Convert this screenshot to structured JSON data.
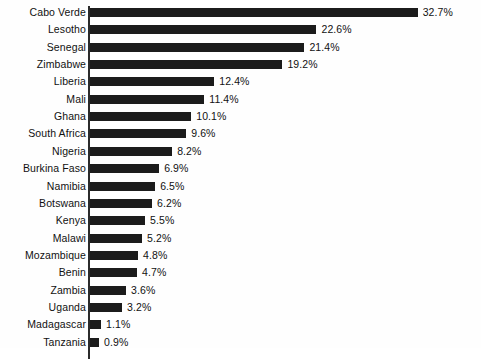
{
  "chart_data": {
    "type": "bar",
    "orientation": "horizontal",
    "title": "",
    "subtitle": "",
    "xlabel": "",
    "ylabel": "",
    "grid": false,
    "legend": null,
    "xlim": [
      0,
      32.7
    ],
    "value_suffix": "%",
    "categories": [
      "Cabo Verde",
      "Lesotho",
      "Senegal",
      "Zimbabwe",
      "Liberia",
      "Mali",
      "Ghana",
      "South Africa",
      "Nigeria",
      "Burkina Faso",
      "Namibia",
      "Botswana",
      "Kenya",
      "Malawi",
      "Mozambique",
      "Benin",
      "Zambia",
      "Uganda",
      "Madagascar",
      "Tanzania"
    ],
    "values": [
      32.7,
      22.6,
      21.4,
      19.2,
      12.4,
      11.4,
      10.1,
      9.6,
      8.2,
      6.9,
      6.5,
      6.2,
      5.5,
      5.2,
      4.8,
      4.7,
      3.6,
      3.2,
      1.1,
      0.9
    ],
    "value_labels": [
      "32.7%",
      "22.6%",
      "21.4%",
      "19.2%",
      "12.4%",
      "11.4%",
      "10.1%",
      "9.6%",
      "8.2%",
      "6.9%",
      "6.5%",
      "6.2%",
      "5.5%",
      "5.2%",
      "4.8%",
      "4.7%",
      "3.6%",
      "3.2%",
      "1.1%",
      "0.9%"
    ],
    "bar_color": "#1b1b1b",
    "axis_color": "#2b2b2b",
    "background_color": "#fefefe",
    "text_color": "#111111"
  }
}
